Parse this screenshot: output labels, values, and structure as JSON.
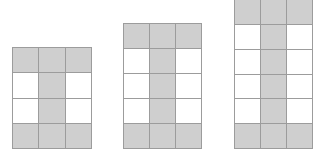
{
  "diagram": {
    "colors": {
      "shaded": "#cfcfcf",
      "unshaded": "#ffffff",
      "grid_line": "#9c9c9c"
    },
    "figures": [
      {
        "index": 1,
        "columns": 3,
        "rows": 4,
        "left": 12,
        "top": 47,
        "width": 80,
        "height": 102,
        "pattern": [
          [
            1,
            1,
            1
          ],
          [
            0,
            1,
            0
          ],
          [
            0,
            1,
            0
          ],
          [
            1,
            1,
            1
          ]
        ]
      },
      {
        "index": 2,
        "columns": 3,
        "rows": 5,
        "left": 123,
        "top": 23,
        "width": 79,
        "height": 126,
        "pattern": [
          [
            1,
            1,
            1
          ],
          [
            0,
            1,
            0
          ],
          [
            0,
            1,
            0
          ],
          [
            0,
            1,
            0
          ],
          [
            1,
            1,
            1
          ]
        ]
      },
      {
        "index": 3,
        "columns": 3,
        "rows": 6,
        "left": 234,
        "top": -1,
        "width": 79,
        "height": 150,
        "pattern": [
          [
            1,
            1,
            1
          ],
          [
            0,
            1,
            0
          ],
          [
            0,
            1,
            0
          ],
          [
            0,
            1,
            0
          ],
          [
            0,
            1,
            0
          ],
          [
            1,
            1,
            1
          ]
        ]
      }
    ]
  }
}
